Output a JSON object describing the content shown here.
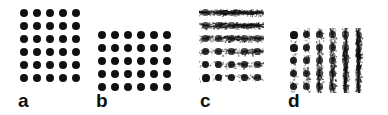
{
  "figure": {
    "background_color": "#ffffff",
    "dot_color": "#101010",
    "width": 388,
    "height": 115
  },
  "panels": [
    {
      "id": "a",
      "label": "a",
      "columns": 5,
      "rows": 6,
      "noise": "none",
      "noise_axis": "none",
      "left": 17,
      "top": 6,
      "cell_width": 13,
      "cell_height": 13,
      "label_left": 18,
      "label_top": 91
    },
    {
      "id": "b",
      "label": "b",
      "columns": 6,
      "rows": 5,
      "noise": "none",
      "noise_axis": "none",
      "left": 95,
      "top": 28,
      "cell_width": 13,
      "cell_height": 13,
      "label_left": 96,
      "label_top": 91
    },
    {
      "id": "c",
      "label": "c",
      "columns": 5,
      "rows": 6,
      "noise": "streaked",
      "noise_axis": "horizontal",
      "left": 199,
      "top": 6,
      "cell_width": 13,
      "cell_height": 13,
      "label_left": 200,
      "label_top": 91
    },
    {
      "id": "d",
      "label": "d",
      "columns": 6,
      "rows": 5,
      "noise": "streaked",
      "noise_axis": "vertical",
      "left": 287,
      "top": 28,
      "cell_width": 13,
      "cell_height": 13,
      "label_left": 288,
      "label_top": 91
    }
  ],
  "chart_data": {
    "type": "scatter",
    "title": "",
    "xlabel": "",
    "ylabel": "",
    "series": [
      {
        "name": "a",
        "columns": 5,
        "rows": 6,
        "count": 30,
        "noise": "none"
      },
      {
        "name": "b",
        "columns": 6,
        "rows": 5,
        "count": 30,
        "noise": "none"
      },
      {
        "name": "c",
        "columns": 5,
        "rows": 6,
        "count": 30,
        "noise": "horizontal-streak"
      },
      {
        "name": "d",
        "columns": 6,
        "rows": 5,
        "count": 30,
        "noise": "vertical-streak"
      }
    ],
    "legend": [
      "a",
      "b",
      "c",
      "d"
    ],
    "grid": false
  }
}
